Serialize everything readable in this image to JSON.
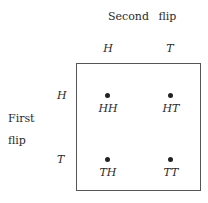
{
  "diagram": {
    "column_axis_label": "Second flip",
    "row_axis_label": [
      "First",
      "flip"
    ],
    "column_headers": [
      "H",
      "T"
    ],
    "row_headers": [
      "H",
      "T"
    ],
    "cells": [
      [
        "HH",
        "HT"
      ],
      [
        "TH",
        "TT"
      ]
    ]
  }
}
